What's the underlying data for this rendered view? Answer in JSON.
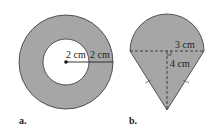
{
  "figures": [
    {
      "id": "a",
      "caption": "a.",
      "shape": "annulus",
      "inner_radius_label": "2 cm",
      "ring_width_label": "2 cm"
    },
    {
      "id": "b",
      "caption": "b.",
      "shape": "semicircle-on-isosceles-triangle",
      "radius_label": "3 cm",
      "height_label": "4 cm"
    }
  ],
  "colors": {
    "fill": "#a6a6a6",
    "stroke": "#333333",
    "background": "#ffffff"
  }
}
